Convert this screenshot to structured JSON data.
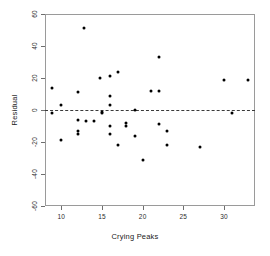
{
  "chart_data": {
    "type": "scatter",
    "title": "",
    "xlabel": "Crying Peaks",
    "ylabel": "Residual",
    "xlim": [
      8.0,
      33.8
    ],
    "ylim": [
      -60,
      60
    ],
    "xticks": [
      10,
      15,
      20,
      25,
      30
    ],
    "xtick_labels": [
      "10",
      "15",
      "20",
      "25",
      "30"
    ],
    "yticks": [
      -60,
      -40,
      -20,
      0,
      20,
      40,
      60
    ],
    "ytick_labels": [
      "-60",
      "-40",
      "-20",
      "0",
      "20",
      "40",
      "60"
    ],
    "grid": false,
    "legend": null,
    "reference_lines": [
      {
        "name": "zero-residual-line",
        "orientation": "horizontal",
        "y": 0,
        "style": "dashed"
      }
    ],
    "marker": {
      "shape": "circle",
      "filled": true,
      "color": "#000000",
      "size": 3
    },
    "points": [
      {
        "x": 8.9,
        "y": 14
      },
      {
        "x": 8.9,
        "y": -2
      },
      {
        "x": 10.0,
        "y": 3
      },
      {
        "x": 10.0,
        "y": -19
      },
      {
        "x": 12.0,
        "y": 11
      },
      {
        "x": 12.0,
        "y": -6
      },
      {
        "x": 12.0,
        "y": -13
      },
      {
        "x": 12.0,
        "y": -15
      },
      {
        "x": 12.8,
        "y": 51
      },
      {
        "x": 13.0,
        "y": -7
      },
      {
        "x": 14.0,
        "y": -7
      },
      {
        "x": 14.8,
        "y": 20
      },
      {
        "x": 15.0,
        "y": -1
      },
      {
        "x": 15.0,
        "y": -2
      },
      {
        "x": 16.0,
        "y": 21
      },
      {
        "x": 16.0,
        "y": 9
      },
      {
        "x": 16.0,
        "y": 3
      },
      {
        "x": 16.0,
        "y": -10
      },
      {
        "x": 16.0,
        "y": -15
      },
      {
        "x": 17.0,
        "y": 24
      },
      {
        "x": 17.0,
        "y": -22
      },
      {
        "x": 18.0,
        "y": -8
      },
      {
        "x": 18.0,
        "y": -10
      },
      {
        "x": 19.0,
        "y": 0
      },
      {
        "x": 19.0,
        "y": -16
      },
      {
        "x": 20.0,
        "y": -31
      },
      {
        "x": 21.0,
        "y": 12
      },
      {
        "x": 22.0,
        "y": 33
      },
      {
        "x": 22.0,
        "y": 12
      },
      {
        "x": 22.0,
        "y": -9
      },
      {
        "x": 23.0,
        "y": -13
      },
      {
        "x": 23.0,
        "y": -22
      },
      {
        "x": 27.0,
        "y": -23
      },
      {
        "x": 30.0,
        "y": 19
      },
      {
        "x": 31.0,
        "y": -2
      },
      {
        "x": 33.0,
        "y": 19
      }
    ]
  }
}
